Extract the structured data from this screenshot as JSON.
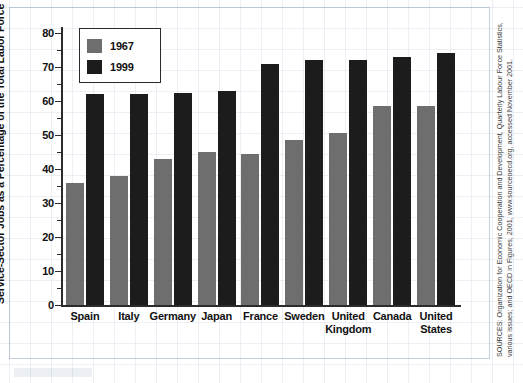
{
  "chart_data": {
    "type": "bar",
    "title": "",
    "xlabel": "",
    "ylabel": "Service-Sector Jobs as a Percentage of the Total Labor Force",
    "ylim": [
      0,
      80
    ],
    "ytick_values": [
      0,
      10,
      20,
      30,
      40,
      50,
      60,
      70,
      80
    ],
    "ytick_labels": [
      "0",
      "10",
      "20",
      "30",
      "40",
      "50",
      "60",
      "70",
      "80"
    ],
    "minor_tick_values": [
      5,
      15,
      25,
      35,
      45,
      55,
      65,
      75
    ],
    "grid": false,
    "legend_position": "upper left",
    "categories": [
      "Spain",
      "Italy",
      "Germany",
      "Japan",
      "France",
      "Sweden",
      "United Kingdom",
      "Canada",
      "United States"
    ],
    "series": [
      {
        "name": "1967",
        "color": "#6e6e6e",
        "values": [
          36.0,
          38.0,
          43.0,
          45.0,
          44.5,
          48.5,
          50.5,
          58.5,
          58.5
        ]
      },
      {
        "name": "1999",
        "color": "#1c1c1c",
        "values": [
          62.0,
          62.0,
          62.5,
          63.0,
          71.0,
          72.0,
          72.0,
          73.0,
          74.0
        ]
      }
    ]
  },
  "legend": {
    "entries": [
      {
        "label": "1967",
        "color": "#6e6e6e"
      },
      {
        "label": "1999",
        "color": "#1c1c1c"
      }
    ]
  },
  "source": {
    "text": "SOURCES: Organization for Economic Cooperation and Development, Quarterly Labour Force Statistics, various issues; and OECD in Figures, 2001, www.sourceoecd.org, accessed November 2001."
  },
  "colors": {
    "series_1967": "#6e6e6e",
    "series_1999": "#1c1c1c",
    "axis": "#2b2b2b",
    "text": "#111111",
    "grid_paper": "#a0afc8"
  }
}
